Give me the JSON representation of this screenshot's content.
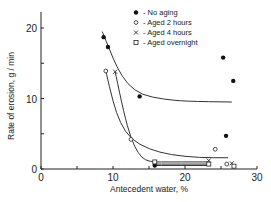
{
  "chart_data": {
    "type": "scatter",
    "title": "",
    "xlabel": "Antecedent water, %",
    "ylabel": "Rate of erosion, g / min",
    "xlim": [
      0,
      30
    ],
    "ylim": [
      0,
      22
    ],
    "xticks": [
      0,
      10,
      20,
      30
    ],
    "xminor": [
      5,
      15,
      25
    ],
    "yticks": [
      0,
      10,
      20
    ],
    "yminor": [
      5,
      15
    ],
    "grid": false,
    "legend_position": "top-right",
    "series": [
      {
        "name": "No aging",
        "marker": "filled-circle",
        "x": [
          8.7,
          9.3,
          13.7,
          25.3,
          26.7,
          25.7,
          15.8
        ],
        "y": [
          18.7,
          17.3,
          10.3,
          15.8,
          12.5,
          4.7,
          0.5
        ]
      },
      {
        "name": "Aged 2 hours",
        "marker": "open-circle",
        "x": [
          9.0,
          12.5,
          24.2,
          25.8
        ],
        "y": [
          13.9,
          4.2,
          2.8,
          0.7
        ]
      },
      {
        "name": "Aged 4 hours",
        "marker": "x",
        "x": [
          10.3,
          23.3,
          26.5
        ],
        "y": [
          13.8,
          1.2,
          0.8
        ]
      },
      {
        "name": "Aged overnight",
        "marker": "open-square",
        "x": [
          15.8,
          23.3,
          26.8
        ],
        "y": [
          1.0,
          0.7,
          0.4
        ]
      }
    ],
    "fitted_curves": [
      {
        "name": "No aging fit",
        "points": [
          [
            8.5,
            19.5
          ],
          [
            9.5,
            17
          ],
          [
            10.5,
            14.5
          ],
          [
            12,
            12
          ],
          [
            14,
            10.5
          ],
          [
            17,
            9.9
          ],
          [
            20,
            9.6
          ],
          [
            26.5,
            9.5
          ]
        ]
      },
      {
        "name": "Aged 2 hours fit",
        "points": [
          [
            9.0,
            13.9
          ],
          [
            10,
            9.5
          ],
          [
            11,
            6.5
          ],
          [
            12.5,
            4.2
          ],
          [
            15,
            2.8
          ],
          [
            18,
            2.0
          ],
          [
            22,
            1.6
          ],
          [
            26,
            1.6
          ]
        ]
      },
      {
        "name": "Aged 4 hours fit",
        "points": [
          [
            10.3,
            13.8
          ],
          [
            11.5,
            8
          ],
          [
            12.5,
            4.3
          ],
          [
            13.5,
            2.2
          ],
          [
            14.5,
            1.2
          ],
          [
            15.8,
            1.0
          ]
        ]
      },
      {
        "name": "Aged 4 hours flat",
        "points": [
          [
            15.8,
            1.0
          ],
          [
            23.3,
            1.0
          ]
        ]
      },
      {
        "name": "Aged overnight flat",
        "points": [
          [
            15.8,
            0.7
          ],
          [
            23.3,
            0.7
          ]
        ]
      },
      {
        "name": "Aged 2 hours flat",
        "points": [
          [
            15.8,
            0.5
          ],
          [
            23.3,
            0.5
          ]
        ]
      }
    ]
  },
  "legend": [
    {
      "symbol": "●",
      "label": "No aging"
    },
    {
      "symbol": "○",
      "label": "Aged 2 hours"
    },
    {
      "symbol": "×",
      "label": "Aged 4 hours"
    },
    {
      "symbol": "□",
      "label": "Aged overnight"
    }
  ],
  "axes": {
    "x_label": "Antecedent water, %",
    "y_label": "Rate of erosion, g / min",
    "x_tick_labels": [
      "0",
      "10",
      "20",
      "30"
    ],
    "y_tick_labels": [
      "0",
      "10",
      "20"
    ]
  }
}
